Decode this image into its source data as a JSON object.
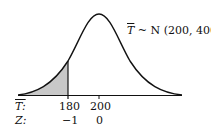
{
  "distribution": {
    "variable": "T",
    "label_rest": " ~ N (200, 400)",
    "mean": 200,
    "variance": 400,
    "sd": 20
  },
  "axis": {
    "row1_label": "T:",
    "row2_label": "Z:",
    "ticks": [
      {
        "t": "180",
        "z": "−1"
      },
      {
        "t": "200",
        "z": "0"
      }
    ]
  },
  "shaded_region": {
    "from": "-inf",
    "to": 180,
    "color": "#c8c8c8"
  },
  "colors": {
    "curve": "#111111",
    "shade": "#c8c8c8"
  }
}
